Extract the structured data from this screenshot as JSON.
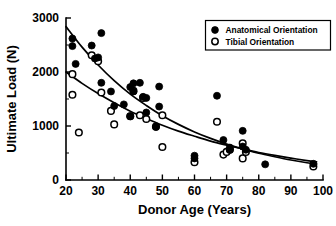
{
  "chart_data": {
    "type": "scatter",
    "title": "",
    "xlabel": "Donor Age (Years)",
    "ylabel": "Ultimate Load (N)",
    "xlim": [
      20,
      100
    ],
    "ylim": [
      0,
      3000
    ],
    "xticks": [
      20,
      30,
      40,
      50,
      60,
      70,
      80,
      90,
      100
    ],
    "xtick_labels": [
      "20",
      "30",
      "40",
      "50",
      "60",
      "70",
      "80",
      "90",
      "100"
    ],
    "xminor_step": 5,
    "yticks": [
      0,
      1000,
      2000,
      3000
    ],
    "ytick_labels": [
      "0",
      "1000",
      "2000",
      "3000"
    ],
    "yminor_step": 500,
    "grid": false,
    "legend_position": "top-right",
    "legend": [
      {
        "label": "Anatomical Orientation",
        "marker": "filled-circle"
      },
      {
        "label": "Tibial Orientation",
        "marker": "open-circle"
      }
    ],
    "series": [
      {
        "name": "Anatomical Orientation",
        "marker": "filled-circle",
        "points": [
          [
            22,
            2620
          ],
          [
            22,
            2480
          ],
          [
            23,
            2150
          ],
          [
            28,
            2490
          ],
          [
            29,
            2250
          ],
          [
            30,
            2270
          ],
          [
            31,
            2720
          ],
          [
            31,
            1800
          ],
          [
            34,
            1640
          ],
          [
            35,
            1370
          ],
          [
            38,
            1400
          ],
          [
            40,
            1180
          ],
          [
            40,
            1720
          ],
          [
            41,
            1790
          ],
          [
            41,
            1640
          ],
          [
            43,
            1800
          ],
          [
            44,
            1540
          ],
          [
            45,
            1520
          ],
          [
            45,
            1250
          ],
          [
            48,
            980
          ],
          [
            49,
            1730
          ],
          [
            49,
            1360
          ],
          [
            60,
            450
          ],
          [
            60,
            400
          ],
          [
            67,
            1560
          ],
          [
            69,
            740
          ],
          [
            71,
            600
          ],
          [
            71,
            560
          ],
          [
            75,
            910
          ],
          [
            75,
            620
          ],
          [
            76,
            560
          ],
          [
            82,
            290
          ],
          [
            97,
            300
          ]
        ]
      },
      {
        "name": "Tibial Orientation",
        "marker": "open-circle",
        "points": [
          [
            22,
            1960
          ],
          [
            22,
            1580
          ],
          [
            24,
            880
          ],
          [
            28,
            2310
          ],
          [
            30,
            2200
          ],
          [
            31,
            1620
          ],
          [
            34,
            1280
          ],
          [
            35,
            1030
          ],
          [
            40,
            1180
          ],
          [
            41,
            1650
          ],
          [
            43,
            1200
          ],
          [
            44,
            1520
          ],
          [
            45,
            1130
          ],
          [
            48,
            990
          ],
          [
            50,
            1200
          ],
          [
            50,
            610
          ],
          [
            60,
            330
          ],
          [
            67,
            1080
          ],
          [
            69,
            470
          ],
          [
            70,
            520
          ],
          [
            71,
            560
          ],
          [
            75,
            680
          ],
          [
            75,
            400
          ],
          [
            76,
            520
          ],
          [
            97,
            250
          ]
        ]
      }
    ],
    "fits": [
      {
        "name": "Anatomical Orientation fit",
        "type": "exponential-decay",
        "description": "upper regression curve",
        "samples": [
          [
            20,
            2840
          ],
          [
            25,
            2460
          ],
          [
            30,
            2130
          ],
          [
            35,
            1840
          ],
          [
            40,
            1590
          ],
          [
            45,
            1380
          ],
          [
            50,
            1190
          ],
          [
            55,
            1030
          ],
          [
            60,
            890
          ],
          [
            65,
            770
          ],
          [
            70,
            665
          ],
          [
            75,
            575
          ],
          [
            80,
            495
          ],
          [
            85,
            430
          ],
          [
            90,
            370
          ],
          [
            95,
            320
          ],
          [
            98,
            295
          ]
        ]
      },
      {
        "name": "Tibial Orientation fit",
        "type": "exponential-decay",
        "description": "lower regression curve",
        "samples": [
          [
            20,
            2000
          ],
          [
            25,
            1790
          ],
          [
            30,
            1600
          ],
          [
            35,
            1430
          ],
          [
            40,
            1275
          ],
          [
            45,
            1140
          ],
          [
            50,
            1015
          ],
          [
            55,
            905
          ],
          [
            60,
            810
          ],
          [
            65,
            720
          ],
          [
            70,
            645
          ],
          [
            75,
            575
          ],
          [
            80,
            510
          ],
          [
            85,
            455
          ],
          [
            90,
            405
          ],
          [
            95,
            360
          ],
          [
            98,
            335
          ]
        ]
      }
    ]
  }
}
